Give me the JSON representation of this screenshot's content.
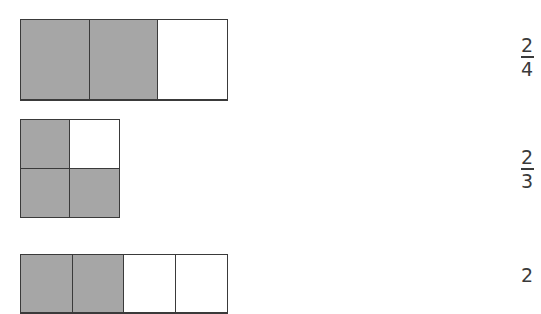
{
  "colors": {
    "shaded": "#a6a6a6",
    "empty": "#ffffff",
    "border": "#3a3a3a",
    "text": "#3a3a3a"
  },
  "rows": [
    {
      "figure": {
        "cols": 3,
        "rows": 1,
        "cells": [
          "shaded",
          "shaded",
          "empty"
        ]
      },
      "fraction": {
        "numerator": "2",
        "denominator": "4"
      }
    },
    {
      "figure": {
        "cols": 2,
        "rows": 2,
        "cells": [
          "shaded",
          "empty",
          "shaded",
          "shaded"
        ]
      },
      "fraction": {
        "numerator": "2",
        "denominator": "3"
      }
    },
    {
      "figure": {
        "cols": 4,
        "rows": 1,
        "cells": [
          "shaded",
          "shaded",
          "empty",
          "empty"
        ]
      },
      "fraction": {
        "numerator": "2",
        "denominator": ""
      }
    }
  ]
}
